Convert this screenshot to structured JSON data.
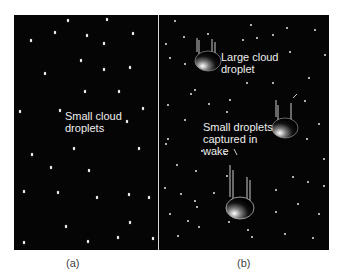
{
  "panels": [
    {
      "id": "a",
      "caption": "(a)",
      "label": "Small cloud\ndroplets"
    },
    {
      "id": "b",
      "caption": "(b)",
      "labels": {
        "large": "Large cloud\ndroplet",
        "small": "Small droplets\ncaptured in\nwake"
      }
    }
  ],
  "colors": {
    "background": "#050505",
    "droplet": "#f0f0f0",
    "divider": "#d8d8d8",
    "caption": "#444444"
  }
}
